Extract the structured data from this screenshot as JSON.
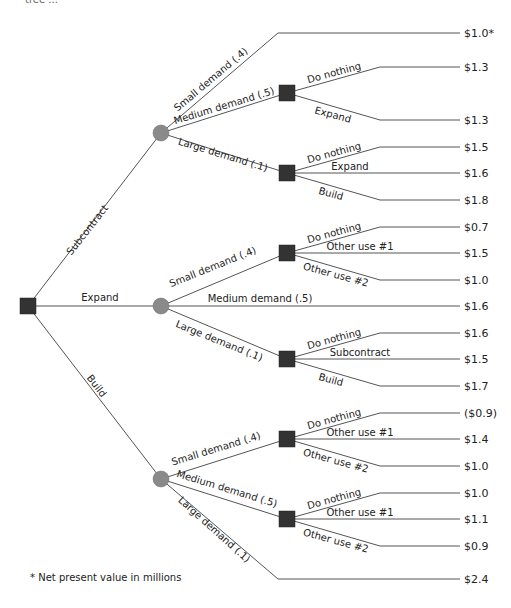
{
  "top_fragment": "tree ...",
  "footnote": "* Net present value in millions",
  "colors": {
    "decision_node": "#333333",
    "chance_node": "#8a8a8a",
    "line": "#555555"
  },
  "root": {
    "type": "decision",
    "x": 28,
    "y": 306
  },
  "first_level": [
    {
      "label": "Subcontract",
      "chance": {
        "x": 161,
        "y": 133
      }
    },
    {
      "label": "Expand",
      "chance": {
        "x": 161,
        "y": 306
      }
    },
    {
      "label": "Build",
      "chance": {
        "x": 161,
        "y": 479
      }
    }
  ],
  "branches": {
    "subcontract": {
      "small": {
        "label": "Small demand (.4)",
        "value": "$1.0*",
        "y": 33
      },
      "medium": {
        "label": "Medium demand (.5)",
        "node": {
          "x": 287,
          "y": 93
        },
        "options": [
          {
            "label": "Do nothing",
            "value": "$1.3",
            "y": 67
          },
          {
            "label": "Expand",
            "value": "$1.3",
            "y": 120
          }
        ]
      },
      "large": {
        "label": "Large demand (.1)",
        "node": {
          "x": 287,
          "y": 173
        },
        "options": [
          {
            "label": "Do nothing",
            "value": "$1.5",
            "y": 147
          },
          {
            "label": "Expand",
            "value": "$1.6",
            "y": 173
          },
          {
            "label": "Build",
            "value": "$1.8",
            "y": 200
          }
        ]
      }
    },
    "expand": {
      "small": {
        "label": "Small demand (.4)",
        "node": {
          "x": 287,
          "y": 253
        },
        "options": [
          {
            "label": "Do nothing",
            "value": "$0.7",
            "y": 227
          },
          {
            "label": "Other use #1",
            "value": "$1.5",
            "y": 253
          },
          {
            "label": "Other use #2",
            "value": "$1.0",
            "y": 280
          }
        ]
      },
      "medium": {
        "label": "Medium demand (.5)",
        "value": "$1.6",
        "y": 306
      },
      "large": {
        "label": "Large demand (.1)",
        "node": {
          "x": 287,
          "y": 359
        },
        "options": [
          {
            "label": "Do nothing",
            "value": "$1.6",
            "y": 333
          },
          {
            "label": "Subcontract",
            "value": "$1.5",
            "y": 359
          },
          {
            "label": "Build",
            "value": "$1.7",
            "y": 386
          }
        ]
      }
    },
    "build": {
      "small": {
        "label": "Small demand (.4)",
        "node": {
          "x": 287,
          "y": 439
        },
        "options": [
          {
            "label": "Do nothing",
            "value": "($0.9)",
            "y": 413
          },
          {
            "label": "Other use #1",
            "value": "$1.4",
            "y": 439
          },
          {
            "label": "Other use #2",
            "value": "$1.0",
            "y": 466
          }
        ]
      },
      "medium": {
        "label": "Medium demand (.5)",
        "node": {
          "x": 287,
          "y": 519
        },
        "options": [
          {
            "label": "Do nothing",
            "value": "$1.0",
            "y": 493
          },
          {
            "label": "Other use #1",
            "value": "$1.1",
            "y": 519
          },
          {
            "label": "Other use #2",
            "value": "$0.9",
            "y": 546
          }
        ]
      },
      "large": {
        "label": "Large demand (.1)",
        "value": "$2.4",
        "y": 579
      }
    }
  }
}
